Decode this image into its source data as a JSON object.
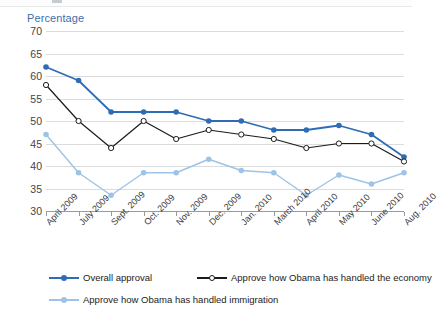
{
  "axis": {
    "y_title": "Percentage",
    "y_ticks": [
      70,
      65,
      60,
      55,
      50,
      45,
      40,
      35,
      30
    ]
  },
  "legend": {
    "items": [
      {
        "label": "Overall approval",
        "color": "#2e6db4",
        "marker": "filled"
      },
      {
        "label": "Approve how Obama has handled the economy",
        "color": "#1b1b1b",
        "marker": "open"
      },
      {
        "label": "Approve how Obama has handled immigration",
        "color": "#9dc3e6",
        "marker": "filled-light"
      }
    ]
  },
  "chart_data": {
    "type": "line",
    "title": "",
    "xlabel": "",
    "ylabel": "Percentage",
    "ylim": [
      30,
      70
    ],
    "grid": true,
    "legend_position": "bottom-left",
    "categories": [
      "April 2009",
      "July 2009",
      "Sept. 2009",
      "Oct. 2009",
      "Nov. 2009",
      "Dec. 2009",
      "Jan. 2010",
      "March 2010",
      "April 2010",
      "May 2010",
      "June 2010",
      "Aug. 2010"
    ],
    "series": [
      {
        "name": "Overall approval",
        "color": "#2e6db4",
        "values": [
          62,
          59,
          52,
          52,
          52,
          50,
          50,
          48,
          48,
          49,
          47,
          42
        ]
      },
      {
        "name": "Approve how Obama has handled the economy",
        "color": "#1b1b1b",
        "values": [
          58,
          50,
          44,
          50,
          46,
          48,
          47,
          46,
          44,
          45,
          45,
          41
        ]
      },
      {
        "name": "Approve how Obama has handled immigration",
        "color": "#9dc3e6",
        "values": [
          47,
          38.5,
          33.5,
          38.5,
          38.5,
          41.5,
          39,
          38.5,
          33.5,
          38,
          36,
          38.5
        ]
      }
    ]
  }
}
